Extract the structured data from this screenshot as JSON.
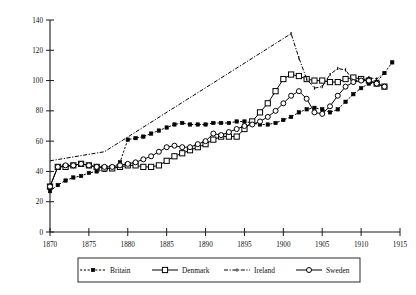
{
  "chart_data": {
    "type": "line",
    "title": "",
    "subtitle": "",
    "xlabel": "",
    "ylabel": "",
    "xlim": [
      1870,
      1915
    ],
    "ylim": [
      0,
      140
    ],
    "xticks": [
      1870,
      1875,
      1880,
      1885,
      1890,
      1895,
      1900,
      1905,
      1910,
      1915
    ],
    "yticks": [
      0,
      20,
      40,
      60,
      80,
      100,
      120,
      140
    ],
    "grid": false,
    "legend_position": "bottom",
    "series": [
      {
        "name": "Britain",
        "marker": "filled-square",
        "line_style": "dotted",
        "x": [
          1870,
          1871,
          1872,
          1873,
          1874,
          1875,
          1876,
          1877,
          1878,
          1879,
          1880,
          1881,
          1882,
          1883,
          1884,
          1885,
          1886,
          1887,
          1888,
          1889,
          1890,
          1891,
          1892,
          1893,
          1894,
          1895,
          1896,
          1897,
          1898,
          1899,
          1900,
          1901,
          1902,
          1903,
          1904,
          1905,
          1906,
          1907,
          1908,
          1909,
          1910,
          1911,
          1912,
          1913,
          1914
        ],
        "values": [
          27,
          31,
          34,
          36,
          37,
          39,
          40,
          41,
          42,
          46,
          61,
          62,
          63,
          65,
          67,
          69,
          71,
          72,
          71,
          71,
          71,
          72,
          72,
          72,
          73,
          73,
          72,
          71,
          71,
          72,
          74,
          76,
          79,
          81,
          82,
          81,
          79,
          81,
          86,
          91,
          95,
          98,
          99,
          105,
          112
        ]
      },
      {
        "name": "Denmark",
        "marker": "open-square",
        "line_style": "solid",
        "x": [
          1870,
          1871,
          1872,
          1873,
          1874,
          1875,
          1876,
          1877,
          1878,
          1879,
          1880,
          1881,
          1882,
          1883,
          1884,
          1885,
          1886,
          1887,
          1888,
          1889,
          1890,
          1891,
          1892,
          1893,
          1894,
          1895,
          1896,
          1897,
          1898,
          1899,
          1900,
          1901,
          1902,
          1903,
          1904,
          1905,
          1906,
          1907,
          1908,
          1909,
          1910,
          1911,
          1912,
          1913
        ],
        "values": [
          30,
          43,
          43,
          44,
          45,
          44,
          43,
          42,
          42,
          43,
          44,
          44,
          43,
          43,
          44,
          47,
          50,
          52,
          54,
          56,
          58,
          61,
          63,
          63,
          63,
          68,
          73,
          79,
          85,
          93,
          101,
          104,
          103,
          101,
          100,
          100,
          99,
          99,
          101,
          102,
          101,
          100,
          98,
          96
        ]
      },
      {
        "name": "Ireland",
        "marker": "tick",
        "line_style": "dash-dot",
        "x": [
          1870,
          1877,
          1901,
          1902,
          1903,
          1904,
          1905,
          1906,
          1907,
          1908,
          1909,
          1910,
          1911,
          1912,
          1913
        ],
        "values": [
          47,
          53,
          131,
          115,
          101,
          95,
          96,
          104,
          108,
          107,
          100,
          100,
          102,
          101,
          105
        ]
      },
      {
        "name": "Sweden",
        "marker": "open-circle",
        "line_style": "solid",
        "x": [
          1870,
          1871,
          1872,
          1873,
          1874,
          1875,
          1876,
          1877,
          1878,
          1879,
          1880,
          1881,
          1882,
          1883,
          1884,
          1885,
          1886,
          1887,
          1888,
          1889,
          1890,
          1891,
          1892,
          1893,
          1894,
          1895,
          1896,
          1897,
          1898,
          1899,
          1900,
          1901,
          1902,
          1903,
          1904,
          1905,
          1906,
          1907,
          1908,
          1909,
          1910,
          1911,
          1912,
          1913
        ],
        "values": [
          30,
          43,
          44,
          44,
          45,
          44,
          43,
          43,
          43,
          44,
          45,
          46,
          48,
          50,
          53,
          56,
          57,
          56,
          56,
          58,
          60,
          65,
          64,
          66,
          68,
          70,
          71,
          73,
          76,
          80,
          85,
          90,
          93,
          88,
          79,
          78,
          83,
          90,
          96,
          99,
          100,
          100,
          98,
          96
        ]
      }
    ]
  },
  "axis": {
    "x_tick_labels": [
      "1870",
      "1875",
      "1880",
      "1885",
      "1890",
      "1895",
      "1900",
      "1905",
      "1910",
      "1915"
    ],
    "y_tick_labels": [
      "0",
      "20",
      "40",
      "60",
      "80",
      "100",
      "120",
      "140"
    ]
  },
  "legend": {
    "entries": [
      {
        "label": "Britain",
        "marker": "filled-square"
      },
      {
        "label": "Denmark",
        "marker": "open-square"
      },
      {
        "label": "Ireland",
        "marker": "tick"
      },
      {
        "label": "Sweden",
        "marker": "open-circle"
      }
    ]
  }
}
